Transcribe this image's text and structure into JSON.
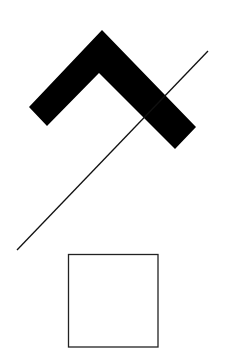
{
  "figure": {
    "shapes": [
      {
        "kind": "chevron",
        "style": "filled",
        "color": "#000000"
      },
      {
        "kind": "line",
        "style": "stroke",
        "color": "#111111"
      },
      {
        "kind": "square",
        "style": "outline",
        "color": "#222222"
      }
    ]
  }
}
